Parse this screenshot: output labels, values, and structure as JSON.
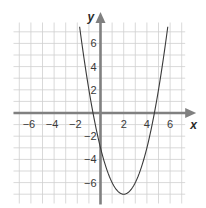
{
  "chart_data": {
    "type": "line",
    "title": "",
    "xlabel": "x",
    "ylabel": "y",
    "xlim": [
      -7.5,
      7.3
    ],
    "ylim": [
      -7.8,
      7.8
    ],
    "grid": true,
    "grid_step": 1,
    "x_ticks": [
      -6,
      -4,
      -2,
      2,
      4,
      6
    ],
    "y_ticks": [
      -6,
      -4,
      -2,
      2,
      4,
      6
    ],
    "x_tick_labels": [
      "−6",
      "−4",
      "−2",
      "2",
      "4",
      "6"
    ],
    "y_tick_labels": [
      "−6",
      "−4",
      "−2",
      "2",
      "4",
      "6"
    ],
    "series": [
      {
        "name": "parabola",
        "equation": "y = x^2 - 4x - 3",
        "vertex": [
          2,
          -7
        ],
        "x_intercepts": [
          -0.65,
          4.65
        ],
        "y_intercept": -3,
        "x": [
          -1.8,
          -1.5,
          -1,
          -0.5,
          0,
          0.5,
          1,
          1.5,
          2,
          2.5,
          3,
          3.5,
          4,
          4.5,
          5,
          5.5,
          5.8
        ],
        "values": [
          7.44,
          5.25,
          2,
          -0.75,
          -3,
          -4.75,
          -6,
          -6.75,
          -7,
          -6.75,
          -6,
          -4.75,
          -3,
          -0.75,
          2,
          5.25,
          7.44
        ]
      }
    ],
    "colors": {
      "axis": "#808080",
      "grid": "#cfcfcf",
      "curve": "#3a3a3a",
      "text": "#3a3a3a"
    }
  }
}
